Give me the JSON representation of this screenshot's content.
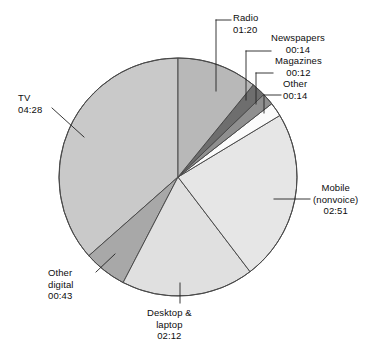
{
  "chart_data": {
    "type": "pie",
    "title": "",
    "unit": "hours:minutes per day",
    "total_minutes": 734,
    "categories": [
      "TV",
      "Mobile (nonvoice)",
      "Desktop & laptop",
      "Radio",
      "Other digital",
      "Newspapers",
      "Magazines",
      "Other"
    ],
    "labels": [
      "04:28",
      "02:51",
      "02:12",
      "01:20",
      "00:43",
      "00:14",
      "00:12",
      "00:14"
    ],
    "values": [
      268,
      171,
      132,
      80,
      43,
      14,
      12,
      14
    ],
    "colors": [
      "#c9c9c9",
      "#e6e6e6",
      "#e0e0e0",
      "#b8b8b8",
      "#a8a8a8",
      "#6e6e6e",
      "#8f8f8f",
      "#fbfbfb"
    ],
    "legend": "none",
    "grid": false
  },
  "slices": [
    {
      "name": "radio",
      "label": "Radio",
      "line2": "",
      "value": "01:20"
    },
    {
      "name": "newspapers",
      "label": "Newspapers",
      "line2": "",
      "value": "00:14"
    },
    {
      "name": "magazines",
      "label": "Magazines",
      "line2": "",
      "value": "00:12"
    },
    {
      "name": "other",
      "label": "Other",
      "line2": "",
      "value": "00:14"
    },
    {
      "name": "mobile",
      "label": "Mobile",
      "line2": "(nonvoice)",
      "value": "02:51"
    },
    {
      "name": "desktop",
      "label": "Desktop &",
      "line2": "laptop",
      "value": "02:12"
    },
    {
      "name": "other-digital",
      "label": "Other",
      "line2": "digital",
      "value": "00:43"
    },
    {
      "name": "tv",
      "label": "TV",
      "line2": "",
      "value": "04:28"
    }
  ]
}
